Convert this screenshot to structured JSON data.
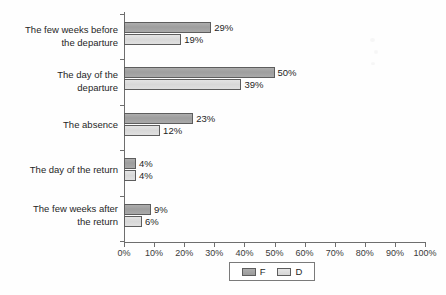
{
  "chart_data": {
    "type": "bar",
    "orientation": "horizontal",
    "title": "",
    "xlabel": "",
    "ylabel": "",
    "xlim": [
      0,
      100
    ],
    "xticks": [
      "0%",
      "10%",
      "20%",
      "30%",
      "40%",
      "50%",
      "60%",
      "70%",
      "80%",
      "90%",
      "100%"
    ],
    "xtick_values": [
      0,
      10,
      20,
      30,
      40,
      50,
      60,
      70,
      80,
      90,
      100
    ],
    "grid": false,
    "legend_position": "bottom-center",
    "categories": [
      "The few weeks before the departure",
      "The day of the departure",
      "The absence",
      "The day of the return",
      "The few weeks after the return"
    ],
    "category_lines": [
      [
        "The few weeks before",
        "the departure"
      ],
      [
        "The day of the",
        "departure"
      ],
      [
        "The absence"
      ],
      [
        "The day of the return"
      ],
      [
        "The few weeks after",
        "the return"
      ]
    ],
    "series": [
      {
        "name": "F",
        "color": "#a6a6a6",
        "values": [
          29,
          50,
          23,
          4,
          9
        ],
        "labels": [
          "29%",
          "50%",
          "23%",
          "4%",
          "9%"
        ]
      },
      {
        "name": "D",
        "color": "#dedede",
        "values": [
          19,
          39,
          12,
          4,
          6
        ],
        "labels": [
          "19%",
          "39%",
          "12%",
          "4%",
          "6%"
        ]
      }
    ]
  },
  "legend": {
    "items": [
      {
        "label": "F",
        "swatch": "series-f"
      },
      {
        "label": "D",
        "swatch": "series-d"
      }
    ]
  },
  "axis": {
    "line_color": "#6e6e6e"
  }
}
